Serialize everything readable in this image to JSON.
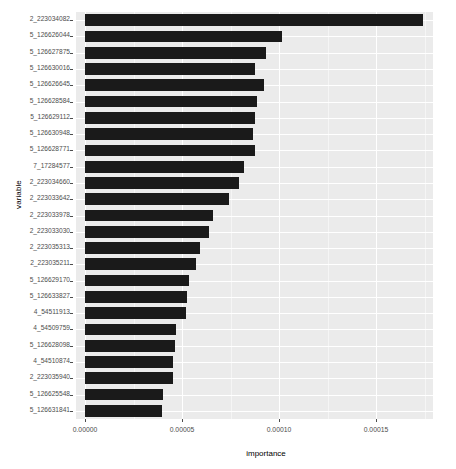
{
  "chart_data": {
    "type": "bar",
    "orientation": "horizontal",
    "title": "",
    "xlabel": "importance",
    "ylabel": "variable",
    "xlim": [
      0,
      0.000184
    ],
    "xticks": [
      "0.00000",
      "0.00005",
      "0.00010",
      "0.00015"
    ],
    "xtick_values": [
      0.0,
      5e-05,
      0.0001,
      0.00015
    ],
    "grid": true,
    "legend": "none",
    "bar_color": "#1a1a1a",
    "panel_color": "#ebebeb",
    "categories": [
      "2_223034082",
      "5_126626044",
      "5_126627875",
      "5_126630016",
      "5_126626645",
      "5_126628584",
      "5_126629112",
      "5_126630948",
      "5_126628771",
      "7_17284577",
      "2_223034660",
      "2_223033642",
      "2_223033978",
      "2_223033030",
      "2_223035313",
      "2_223035211",
      "5_126629170",
      "5_126633827",
      "4_54511913",
      "4_54509759",
      "5_126628098",
      "4_54510874",
      "2_223035940",
      "5_126625548",
      "5_126631841"
    ],
    "values": [
      0.0001742,
      0.0001015,
      9.33e-05,
      8.76e-05,
      9.23e-05,
      8.87e-05,
      8.76e-05,
      8.66e-05,
      8.76e-05,
      8.2e-05,
      7.94e-05,
      7.42e-05,
      6.6e-05,
      6.39e-05,
      5.93e-05,
      5.72e-05,
      5.36e-05,
      5.26e-05,
      5.21e-05,
      4.69e-05,
      4.64e-05,
      4.54e-05,
      4.54e-05,
      4.02e-05,
      3.97e-05
    ]
  }
}
